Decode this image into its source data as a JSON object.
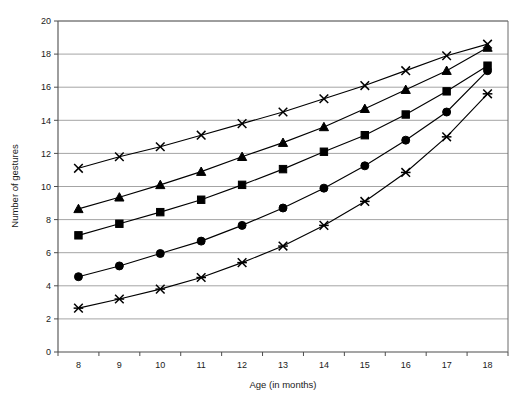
{
  "chart_data": {
    "type": "line",
    "title": "",
    "xlabel": "Age (in months)",
    "ylabel": "Number of gestures",
    "x": [
      8,
      9,
      10,
      11,
      12,
      13,
      14,
      15,
      16,
      17,
      18
    ],
    "x_tick_labels": [
      "8",
      "9",
      "10",
      "11",
      "12",
      "13",
      "14",
      "15",
      "16",
      "17",
      "18"
    ],
    "y_tick_labels": [
      "0",
      "2",
      "4",
      "6",
      "8",
      "10",
      "12",
      "14",
      "16",
      "18",
      "20"
    ],
    "y_ticks": [
      0,
      2,
      4,
      6,
      8,
      10,
      12,
      14,
      16,
      18,
      20
    ],
    "ylim": [
      0,
      20
    ],
    "grid": "horizontal",
    "legend": "none",
    "series": [
      {
        "name": "series-1",
        "marker": "x",
        "color": "#000000",
        "values": [
          11.1,
          11.8,
          12.4,
          13.1,
          13.8,
          14.5,
          15.3,
          16.1,
          17.0,
          17.9,
          18.6
        ]
      },
      {
        "name": "series-2",
        "marker": "triangle",
        "color": "#000000",
        "values": [
          8.65,
          9.35,
          10.1,
          10.9,
          11.8,
          12.65,
          13.6,
          14.7,
          15.85,
          17.0,
          18.4
        ]
      },
      {
        "name": "series-3",
        "marker": "square",
        "color": "#000000",
        "values": [
          7.05,
          7.75,
          8.45,
          9.2,
          10.1,
          11.05,
          12.1,
          13.1,
          14.35,
          15.75,
          17.3
        ]
      },
      {
        "name": "series-4",
        "marker": "circle",
        "color": "#000000",
        "values": [
          4.55,
          5.2,
          5.95,
          6.7,
          7.65,
          8.7,
          9.9,
          11.25,
          12.8,
          14.5,
          17.0
        ]
      },
      {
        "name": "series-5",
        "marker": "star",
        "color": "#000000",
        "values": [
          2.65,
          3.2,
          3.8,
          4.5,
          5.4,
          6.4,
          7.65,
          9.1,
          10.85,
          13.0,
          15.6
        ]
      }
    ]
  },
  "colors": {
    "ink": "#000000",
    "grid": "#9a9a9a",
    "axis": "#4d4d4d",
    "background": "#ffffff"
  }
}
